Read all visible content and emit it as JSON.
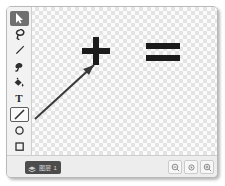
{
  "window": {
    "title": ""
  },
  "tool_palette": {
    "name": "tools",
    "items": [
      {
        "id": "select",
        "icon": "cursor-arrow-icon",
        "label": "",
        "state": "selected"
      },
      {
        "id": "lasso",
        "icon": "lasso-icon",
        "label": "",
        "state": "normal"
      },
      {
        "id": "pencil",
        "icon": "pencil-icon",
        "label": "",
        "state": "normal"
      },
      {
        "id": "eraser",
        "icon": "eraser-icon",
        "label": "",
        "state": "normal"
      },
      {
        "id": "fill",
        "icon": "paint-bucket-icon",
        "label": "",
        "state": "normal"
      },
      {
        "id": "text",
        "icon": "text-tool-icon",
        "label": "T",
        "state": "normal"
      },
      {
        "id": "line",
        "icon": "line-tool-icon",
        "label": "",
        "state": "outlined"
      },
      {
        "id": "ellipse",
        "icon": "ellipse-tool-icon",
        "label": "",
        "state": "normal"
      },
      {
        "id": "rectangle",
        "icon": "rectangle-tool-icon",
        "label": "",
        "state": "normal"
      }
    ]
  },
  "canvas": {
    "name": "drawing-canvas",
    "background": "transparent-checkerboard",
    "stroke_color": "#1b1b1b",
    "shapes": [
      {
        "id": "plus-sign",
        "type": "glyph",
        "text": "+",
        "x": 89,
        "y": 46
      },
      {
        "id": "equals-sign",
        "type": "glyph",
        "text": "=",
        "x": 155,
        "y": 46
      },
      {
        "id": "arrow",
        "type": "arrow",
        "x1": 28,
        "y1": 112,
        "x2": 89,
        "y2": 57
      }
    ]
  },
  "status_bar": {
    "pill": {
      "icon": "layers-icon",
      "text": "图层 1"
    },
    "zoom_controls": [
      {
        "id": "zoom-out",
        "icon": "zoom-out-icon"
      },
      {
        "id": "zoom-reset",
        "icon": "zoom-reset-icon"
      },
      {
        "id": "zoom-in",
        "icon": "zoom-in-icon"
      }
    ]
  }
}
